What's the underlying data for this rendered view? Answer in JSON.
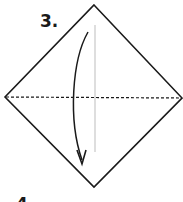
{
  "diagram": {
    "step_label": "3.",
    "next_step_label": "4.",
    "shape": "square-diamond",
    "vertices": {
      "top": [
        94,
        5
      ],
      "right": [
        182,
        98
      ],
      "bottom": [
        94,
        187
      ],
      "left": [
        5,
        97
      ]
    },
    "center_crease": {
      "style": "solid-light",
      "from": [
        95,
        25
      ],
      "to": [
        95,
        152
      ]
    },
    "valley_fold_line": {
      "style": "dashed",
      "from": [
        5,
        97
      ],
      "to": [
        182,
        98
      ]
    },
    "fold_arrow": {
      "direction": "down",
      "from": [
        88,
        32
      ],
      "to": [
        82,
        163
      ]
    },
    "colors": {
      "outline": "#1a1a1a",
      "crease": "#bdbdbd",
      "background": "#ffffff"
    }
  }
}
